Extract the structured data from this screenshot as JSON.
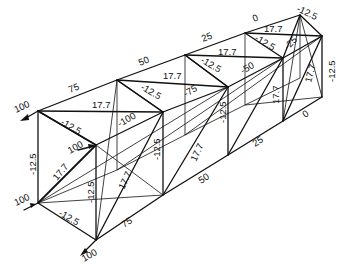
{
  "diagram": {
    "type": "space-truss-member-forces",
    "labels": {
      "load_top_left": "100",
      "load_mid_left": "100",
      "load_bottom_left": "100",
      "load_front_inner": "100",
      "top_chord_bay1": "75",
      "top_chord_bay2": "50",
      "top_chord_bay3": "25",
      "top_chord_bay4": "0",
      "top_diag_bay1": "17.7",
      "top_diag_bay2": "17.7",
      "top_diag_bay3": "17.7",
      "top_diag_bay4": "17.7",
      "top_cross_bay1": "-12.5",
      "top_cross_bay2": "-12.5",
      "top_cross_bay3": "-12.5",
      "top_cross_bay4": "-12.5",
      "top_end": "-12.5",
      "web_bay1": "-100",
      "web_bay2": "-75",
      "web_bay3": "-50",
      "web_bay4": "-25",
      "front_vertical_left": "-12.5",
      "front_diag": "17.7",
      "front_inner_vertical": "-12.5",
      "front_bottom": "-12.5",
      "side_vert_bay1": "-12.5",
      "side_vert_bay2": "-12.5",
      "side_diag_bay1": "17.7",
      "side_diag_bay2": "17.7",
      "side_diag_bay3": "17.7",
      "end_diag": "17.7",
      "end_vertical": "-12.5",
      "bottom_chord_bay1": "75",
      "bottom_chord_bay2": "50",
      "bottom_chord_bay3": "25",
      "bottom_chord_bay4": "0"
    }
  }
}
